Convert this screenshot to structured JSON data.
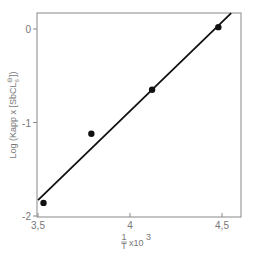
{
  "chart_data": {
    "type": "scatter",
    "title": "",
    "xlabel": "1/T x10³",
    "xlabel_parts": {
      "frac_num": "1",
      "frac_den": "T",
      "suffix": "x10",
      "exp": "3"
    },
    "ylabel": "Log (Kapp x [SbCl6⁻])",
    "ylabel_parts": {
      "prefix": "Log (Kapp x [SbCL",
      "sub": "6",
      "sup": "⊖",
      "suffix": "])"
    },
    "xlim": [
      3.5,
      4.6
    ],
    "ylim": [
      -2.0,
      0.17
    ],
    "x_ticks": [
      {
        "value": 3.5,
        "label": "3,5"
      },
      {
        "value": 4.0,
        "label": "4"
      },
      {
        "value": 4.5,
        "label": "4,5"
      }
    ],
    "y_ticks": [
      {
        "value": 0,
        "label": "0"
      },
      {
        "value": -1,
        "label": "-1"
      },
      {
        "value": -2,
        "label": "-2"
      }
    ],
    "grid": false,
    "legend": null,
    "series": [
      {
        "name": "measured",
        "marker": "filled-circle",
        "points": [
          {
            "x": 3.53,
            "y": -1.86
          },
          {
            "x": 3.79,
            "y": -1.12
          },
          {
            "x": 4.12,
            "y": -0.65
          },
          {
            "x": 4.48,
            "y": 0.02
          }
        ]
      },
      {
        "name": "linear fit",
        "marker": "line",
        "points": [
          {
            "x": 3.5,
            "y": -1.83
          },
          {
            "x": 4.55,
            "y": 0.17
          }
        ]
      }
    ]
  },
  "colors": {
    "axis": "#888888",
    "line": "#111111",
    "marker": "#111111",
    "text": "#777777"
  }
}
